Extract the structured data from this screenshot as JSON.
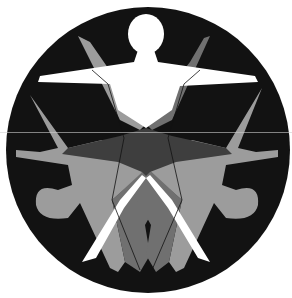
{
  "emblem": {
    "description": "Circular black emblem with three overlapping stylized human figures",
    "colors": {
      "background": "#ffffff",
      "circle": "#121212",
      "figure_top": "#ffffff",
      "figure_side_light": "#9c9c9c",
      "figure_side_mid": "#707070",
      "overlap_dark": "#3e3e3e",
      "outline": "#111111"
    }
  }
}
